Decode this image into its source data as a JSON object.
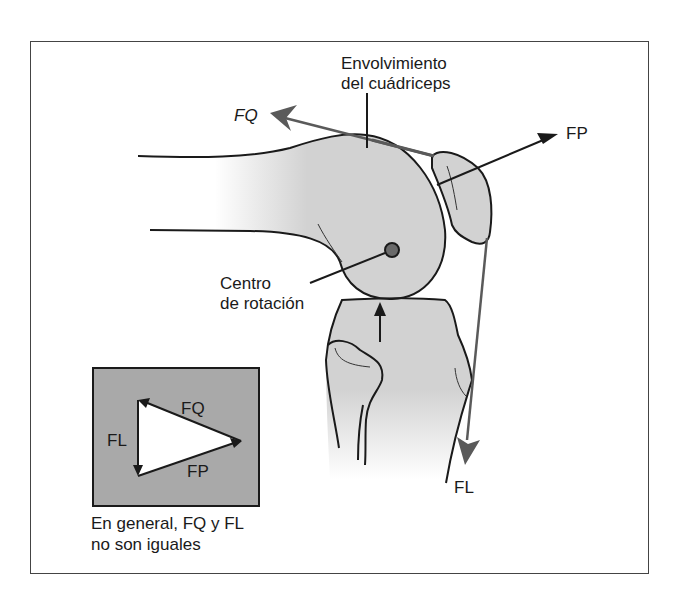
{
  "figure": {
    "labels": {
      "quad_wrap_line1": "Envolvimiento",
      "quad_wrap_line2": "del cuádriceps",
      "fq": "FQ",
      "fp": "FP",
      "fl": "FL",
      "center_line1": "Centro",
      "center_line2": "de rotación"
    },
    "inset": {
      "fq": "FQ",
      "fl": "FL",
      "fp": "FP",
      "caption_line1": "En general, FQ y FL",
      "caption_line2": "no son iguales"
    },
    "colors": {
      "bone_fill": "#d2d2d2",
      "inset_fill": "#a9a9a9",
      "force_arrow": "#5a5a5a",
      "outline": "#1a1a1a"
    }
  }
}
